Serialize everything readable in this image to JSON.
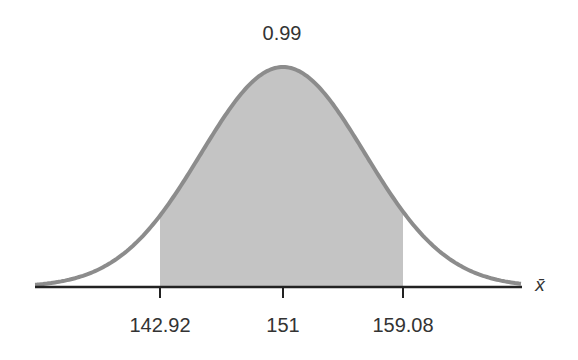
{
  "chart_data": {
    "type": "area",
    "title": "",
    "distribution": "normal",
    "mean": 151,
    "shaded_interval": [
      142.92,
      159.08
    ],
    "shaded_area_label": "0.99",
    "xlabel": "x̄",
    "ylabel": "",
    "x_ticks": [
      "142.92",
      "151",
      "159.08"
    ],
    "grid": false,
    "legend": null
  },
  "labels": {
    "area": "0.99",
    "tick_left": "142.92",
    "tick_mid": "151",
    "tick_right": "159.08",
    "axis": "x̄"
  },
  "colors": {
    "curve": "#8c8c8c",
    "fill": "#c4c4c4",
    "axis": "#222222",
    "text": "#333333"
  }
}
